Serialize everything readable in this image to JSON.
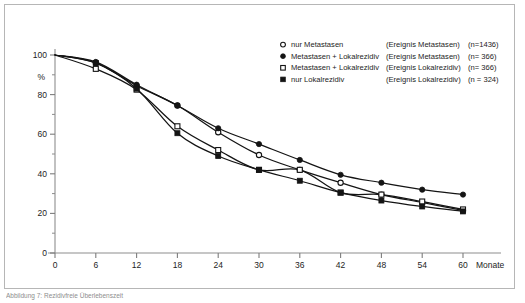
{
  "figure": {
    "background": "#ffffff",
    "border_color": "#b6b6b6",
    "caption": "Abbildung 7: Rezidivfreie Überlebenszeit"
  },
  "chart_data": {
    "type": "line",
    "title": "",
    "xlabel": "Monate",
    "ylabel": "%",
    "x": [
      0,
      6,
      12,
      18,
      24,
      30,
      36,
      42,
      48,
      54,
      60
    ],
    "xlim": [
      0,
      60
    ],
    "ylim": [
      0,
      100
    ],
    "xticks": [
      "0",
      "6",
      "12",
      "18",
      "24",
      "30",
      "36",
      "42",
      "48",
      "54",
      "60"
    ],
    "yticks": [
      "0",
      "20",
      "40",
      "60",
      "80",
      "100"
    ],
    "grid": false,
    "legend_position": "top-right",
    "series": [
      {
        "name": "nur Metastasen",
        "event": "(Ereignis Metastasen)",
        "n_label": "(n=1436)",
        "marker": "open-circle",
        "color": "#141414",
        "values": [
          100,
          96,
          84.5,
          74.5,
          61,
          49.5,
          42,
          35.5,
          29.5,
          25.5,
          21.5
        ]
      },
      {
        "name": "Metastasen + Lokalrezidiv",
        "event": "(Ereignis Metastasen)",
        "n_label": "(n= 366)",
        "marker": "filled-circle",
        "color": "#141414",
        "values": [
          100,
          96.5,
          85,
          74.5,
          63,
          55,
          47,
          39.5,
          35.5,
          32,
          29.5
        ]
      },
      {
        "name": "Metastasen + Lokalrezidiv",
        "event": "(Ereignis Lokalrezidiv)",
        "n_label": "(n= 366)",
        "marker": "open-square",
        "color": "#141414",
        "values": [
          100,
          93,
          82.5,
          64,
          52,
          42,
          42,
          30.5,
          29.5,
          26,
          22
        ]
      },
      {
        "name": "nur Lokalrezidiv",
        "event": "(Ereignis Lokalrezidiv)",
        "n_label": "(n = 324)",
        "marker": "filled-square",
        "color": "#141414",
        "values": [
          100,
          96,
          83,
          60.5,
          49,
          42,
          36.5,
          30.5,
          26.5,
          23.5,
          21
        ]
      }
    ]
  }
}
